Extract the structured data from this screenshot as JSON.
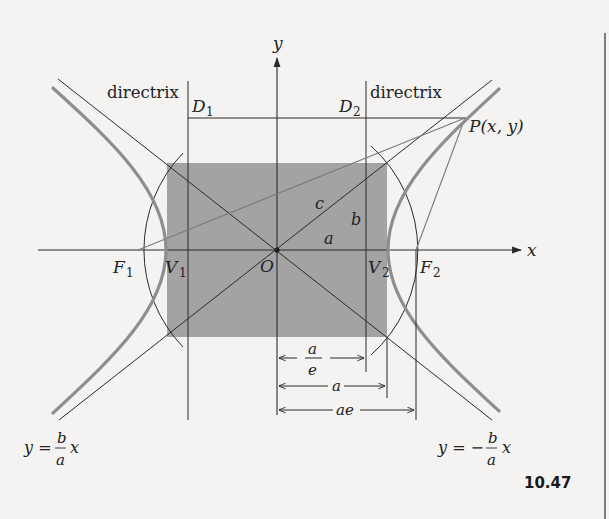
{
  "figure": {
    "number": "10.47",
    "colors": {
      "background": "#f4f3f1",
      "rectangle_fill": "#a3a3a3",
      "hyperbola": "#8e8e8e",
      "line": "#2a2a2a"
    }
  },
  "axes": {
    "x_label": "x",
    "y_label": "y",
    "origin_label": "O"
  },
  "points": {
    "F1": {
      "main": "F",
      "sub": "1"
    },
    "F2": {
      "main": "F",
      "sub": "2"
    },
    "V1": {
      "main": "V",
      "sub": "1"
    },
    "V2": {
      "main": "V",
      "sub": "2"
    },
    "D1": {
      "main": "D",
      "sub": "1"
    },
    "D2": {
      "main": "D",
      "sub": "2"
    },
    "P": "P(x, y)"
  },
  "directrix_labels": {
    "left": "directrix",
    "right": "directrix"
  },
  "segment_labels": {
    "c": "c",
    "b": "b",
    "a": "a"
  },
  "dimensions": [
    {
      "label_num": "a",
      "label_den": "e",
      "meaning": "a/e"
    },
    {
      "label": "a"
    },
    {
      "label": "ae"
    }
  ],
  "asymptotes": {
    "left": {
      "lhs": "y =",
      "num": "b",
      "den": "a",
      "var": "x"
    },
    "right": {
      "lhs": "y = −",
      "num": "b",
      "den": "a",
      "var": "x"
    }
  }
}
